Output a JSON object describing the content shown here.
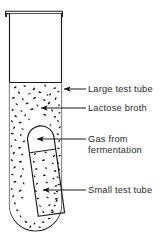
{
  "figure": {
    "type": "labeled-science-diagram",
    "background_color": "#ffffff",
    "line_color": "#1a1a1a",
    "text_color": "#2b2b2b"
  },
  "labels": [
    {
      "id": "large-test-tube",
      "text": "Large test tube",
      "lines": [
        "Large test tube"
      ],
      "arrow": {
        "from_x": 86,
        "from_y": 89,
        "to_x": 63,
        "to_y": 89,
        "direction": "left"
      }
    },
    {
      "id": "lactose-broth",
      "text": "Lactose broth",
      "lines": [
        "Lactose broth"
      ],
      "arrow": {
        "from_x": 86,
        "from_y": 108,
        "to_x": 40,
        "to_y": 108,
        "direction": "left"
      }
    },
    {
      "id": "gas-from-fermentation",
      "text": "Gas from fermentation",
      "lines": [
        "Gas from",
        "fermentation"
      ],
      "arrow": {
        "from_x": 86,
        "from_y": 139,
        "to_x": 36,
        "to_y": 139,
        "direction": "left"
      }
    },
    {
      "id": "small-test-tube",
      "text": "Small test tube",
      "lines": [
        "Small test tube"
      ],
      "arrow": {
        "from_x": 86,
        "from_y": 190,
        "to_x": 42,
        "to_y": 190,
        "direction": "left"
      }
    }
  ],
  "apparatus": {
    "large_tube": {
      "name": "Large test tube",
      "rim_left": 5,
      "rim_right": 63,
      "rim_top": 10,
      "rim_bottom": 17,
      "wall_left": 9,
      "wall_right": 62,
      "bottom_y": 231,
      "corner_radius": 26
    },
    "broth": {
      "name": "Lactose broth",
      "surface_y": 82,
      "speckle_count": 108,
      "speckle_color": "#111111"
    },
    "small_tube": {
      "name": "Small test tube (Durham tube)",
      "orientation": "inverted-tilted",
      "tilt_degrees": 8,
      "top_y": 123,
      "bottom_y": 216,
      "gas_boundary_y": 148
    },
    "gas": {
      "name": "Gas from fermentation",
      "location": "trapped at closed top of small test tube"
    }
  }
}
